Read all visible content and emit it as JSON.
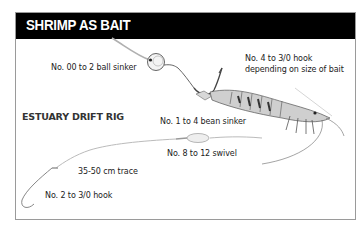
{
  "header": {
    "title": "SHRIMP AS BAIT"
  },
  "section": {
    "title": "ESTUARY DRIFT RIG"
  },
  "labels": {
    "ball_sinker": "No. 00 to 2 ball sinker",
    "hook_top_line1": "No. 4 to 3/0 hook",
    "hook_top_line2": "depending on size of bait",
    "bean_sinker": "No. 1 to 4 bean sinker",
    "swivel": "No. 8 to 12 swivel",
    "trace": "35-50 cm trace",
    "hook_bottom": "No. 2 to 3/0 hook"
  },
  "colors": {
    "header_bg": "#000000",
    "header_text": "#ffffff",
    "frame": "#9a9a9a",
    "line": "#b8b8b8"
  }
}
